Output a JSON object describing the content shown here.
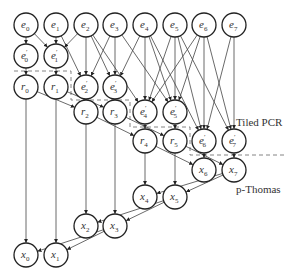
{
  "diagram": {
    "labels": {
      "tiled_pcr": "Tiled PCR",
      "p_thomas": "p-Thomas"
    },
    "nodes": [
      {
        "id": "e0",
        "base": "e",
        "sub": "0",
        "prime": false,
        "x": 26,
        "y": 25
      },
      {
        "id": "e1",
        "base": "e",
        "sub": "1",
        "prime": false,
        "x": 56,
        "y": 25
      },
      {
        "id": "e2",
        "base": "e",
        "sub": "2",
        "prime": false,
        "x": 86,
        "y": 25
      },
      {
        "id": "e3",
        "base": "e",
        "sub": "3",
        "prime": false,
        "x": 115,
        "y": 25
      },
      {
        "id": "e4",
        "base": "e",
        "sub": "4",
        "prime": false,
        "x": 145,
        "y": 25
      },
      {
        "id": "e5",
        "base": "e",
        "sub": "5",
        "prime": false,
        "x": 175,
        "y": 25
      },
      {
        "id": "e6",
        "base": "e",
        "sub": "6",
        "prime": false,
        "x": 204,
        "y": 25
      },
      {
        "id": "e7",
        "base": "e",
        "sub": "7",
        "prime": false,
        "x": 234,
        "y": 25
      },
      {
        "id": "ep0",
        "base": "e",
        "sub": "0",
        "prime": true,
        "x": 26,
        "y": 56
      },
      {
        "id": "ep1",
        "base": "e",
        "sub": "1",
        "prime": true,
        "x": 56,
        "y": 56
      },
      {
        "id": "r0",
        "base": "r",
        "sub": "0",
        "prime": false,
        "x": 26,
        "y": 87
      },
      {
        "id": "r1",
        "base": "r",
        "sub": "1",
        "prime": false,
        "x": 56,
        "y": 87
      },
      {
        "id": "ep2",
        "base": "e",
        "sub": "2",
        "prime": true,
        "x": 86,
        "y": 87
      },
      {
        "id": "ep3",
        "base": "e",
        "sub": "3",
        "prime": true,
        "x": 115,
        "y": 87
      },
      {
        "id": "r2",
        "base": "r",
        "sub": "2",
        "prime": false,
        "x": 86,
        "y": 112
      },
      {
        "id": "r3",
        "base": "r",
        "sub": "3",
        "prime": false,
        "x": 115,
        "y": 112
      },
      {
        "id": "ep4",
        "base": "e",
        "sub": "4",
        "prime": true,
        "x": 145,
        "y": 112
      },
      {
        "id": "ep5",
        "base": "e",
        "sub": "5",
        "prime": true,
        "x": 175,
        "y": 112
      },
      {
        "id": "r4",
        "base": "r",
        "sub": "4",
        "prime": false,
        "x": 145,
        "y": 141
      },
      {
        "id": "r5",
        "base": "r",
        "sub": "5",
        "prime": false,
        "x": 175,
        "y": 141
      },
      {
        "id": "ep6",
        "base": "e",
        "sub": "6",
        "prime": true,
        "x": 204,
        "y": 141
      },
      {
        "id": "ep7",
        "base": "e",
        "sub": "7",
        "prime": true,
        "x": 234,
        "y": 141
      },
      {
        "id": "x6",
        "base": "x",
        "sub": "6",
        "prime": false,
        "x": 204,
        "y": 170
      },
      {
        "id": "x7",
        "base": "x",
        "sub": "7",
        "prime": false,
        "x": 234,
        "y": 170
      },
      {
        "id": "x4",
        "base": "x",
        "sub": "4",
        "prime": false,
        "x": 145,
        "y": 197
      },
      {
        "id": "x5",
        "base": "x",
        "sub": "5",
        "prime": false,
        "x": 175,
        "y": 197
      },
      {
        "id": "x2",
        "base": "x",
        "sub": "2",
        "prime": false,
        "x": 86,
        "y": 226
      },
      {
        "id": "x3",
        "base": "x",
        "sub": "3",
        "prime": false,
        "x": 115,
        "y": 226
      },
      {
        "id": "x0",
        "base": "x",
        "sub": "0",
        "prime": false,
        "x": 26,
        "y": 255
      },
      {
        "id": "x1",
        "base": "x",
        "sub": "1",
        "prime": false,
        "x": 56,
        "y": 255
      }
    ],
    "edges": [
      [
        "e0",
        "ep0"
      ],
      [
        "e0",
        "ep1"
      ],
      [
        "e1",
        "ep1"
      ],
      [
        "e1",
        "ep2"
      ],
      [
        "e2",
        "ep1"
      ],
      [
        "e2",
        "ep2"
      ],
      [
        "e2",
        "ep3"
      ],
      [
        "e3",
        "ep2"
      ],
      [
        "e3",
        "ep3"
      ],
      [
        "e2",
        "ep4"
      ],
      [
        "e3",
        "ep5"
      ],
      [
        "e4",
        "ep3"
      ],
      [
        "e4",
        "ep4"
      ],
      [
        "e4",
        "ep5"
      ],
      [
        "e5",
        "ep4"
      ],
      [
        "e5",
        "ep5"
      ],
      [
        "e6",
        "ep4"
      ],
      [
        "e6",
        "ep5"
      ],
      [
        "e4",
        "ep6"
      ],
      [
        "e5",
        "ep6"
      ],
      [
        "e5",
        "ep7"
      ],
      [
        "e6",
        "ep6"
      ],
      [
        "e6",
        "ep7"
      ],
      [
        "e7",
        "ep6"
      ],
      [
        "e7",
        "ep7"
      ],
      [
        "ep0",
        "r0"
      ],
      [
        "ep1",
        "r1"
      ],
      [
        "ep2",
        "r2"
      ],
      [
        "ep3",
        "r3"
      ],
      [
        "ep4",
        "r4"
      ],
      [
        "ep5",
        "r5"
      ],
      [
        "r0",
        "r2"
      ],
      [
        "r1",
        "r3"
      ],
      [
        "r2",
        "r4"
      ],
      [
        "r3",
        "r5"
      ],
      [
        "r4",
        "x6"
      ],
      [
        "r5",
        "x7"
      ],
      [
        "ep6",
        "x6"
      ],
      [
        "ep7",
        "x7"
      ],
      [
        "x7",
        "x4"
      ],
      [
        "x7",
        "x5"
      ],
      [
        "r4",
        "x4"
      ],
      [
        "r5",
        "x5"
      ],
      [
        "x5",
        "x2"
      ],
      [
        "x5",
        "x3"
      ],
      [
        "r2",
        "x2"
      ],
      [
        "r3",
        "x3"
      ],
      [
        "x3",
        "x0"
      ],
      [
        "x3",
        "x1"
      ],
      [
        "r0",
        "x0"
      ],
      [
        "r1",
        "x1"
      ]
    ]
  }
}
